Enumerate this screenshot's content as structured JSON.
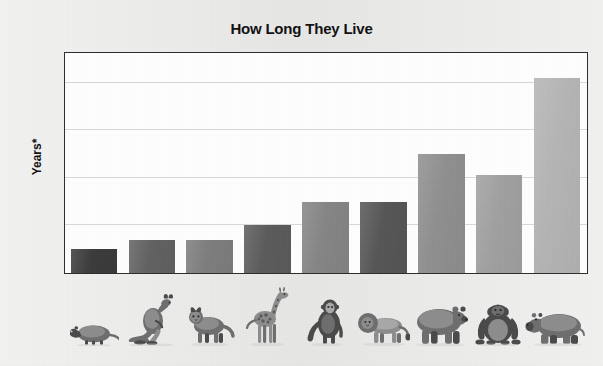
{
  "chart_data": {
    "type": "bar",
    "title": "How Long They Live",
    "xlabel": "",
    "ylabel": "Years*",
    "ylim": [
      0,
      46
    ],
    "yticks": [
      0,
      10,
      20,
      30,
      40
    ],
    "ytick_labels": [
      "0",
      "10",
      "20",
      "30",
      "40"
    ],
    "grid": true,
    "legend": "none",
    "categories": [
      "opossum",
      "kangaroo",
      "lynx",
      "giraffe",
      "monkey",
      "lion",
      "bear",
      "gorilla",
      "hippopotamus"
    ],
    "values": [
      5,
      7,
      7,
      10,
      15,
      15,
      25,
      20.5,
      41
    ],
    "bar_colors": [
      "#3b3b3b",
      "#616161",
      "#7d7d7d",
      "#5b5b5b",
      "#858585",
      "#565656",
      "#8f8f8f",
      "#a0a0a0",
      "#b4b4b4"
    ]
  },
  "chart": {
    "title": "How Long They Live",
    "y_axis_label": "Years*",
    "y_ticks": [
      "40",
      "30",
      "20",
      "10",
      "0"
    ]
  },
  "animals": [
    {
      "name": "opossum",
      "icon": "opossum-icon"
    },
    {
      "name": "kangaroo",
      "icon": "kangaroo-icon"
    },
    {
      "name": "lynx",
      "icon": "lynx-icon"
    },
    {
      "name": "giraffe",
      "icon": "giraffe-icon"
    },
    {
      "name": "monkey",
      "icon": "monkey-icon"
    },
    {
      "name": "lion",
      "icon": "lion-icon"
    },
    {
      "name": "bear",
      "icon": "bear-icon"
    },
    {
      "name": "gorilla",
      "icon": "gorilla-icon"
    },
    {
      "name": "hippopotamus",
      "icon": "hippopotamus-icon"
    }
  ],
  "colors": {
    "page_background": "#ebebea",
    "plot_background": "#fefefe",
    "frame": "#2d2d2d",
    "gridline": "#d8d8d8",
    "text": "#111111"
  }
}
